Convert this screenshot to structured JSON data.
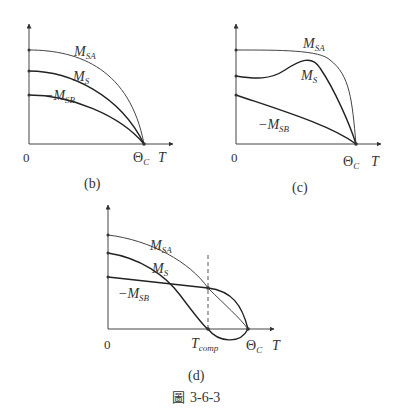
{
  "figure": {
    "caption": "圖 3-6-3",
    "caption_prefix": "圖",
    "caption_number": "3-6-3",
    "colors": {
      "axis": "#444444",
      "curve": "#333333",
      "dashed": "#555555",
      "text": "#333333"
    }
  },
  "panels": [
    {
      "id": "b",
      "label": "(b)",
      "origin_label": "0",
      "x_axis_label": "T",
      "curie_label": "Θ",
      "curie_sub": "C",
      "curves": [
        {
          "name": "M",
          "sub": "SA"
        },
        {
          "name": "M",
          "sub": "S"
        },
        {
          "name": "−M",
          "sub": "SB"
        }
      ]
    },
    {
      "id": "c",
      "label": "(c)",
      "origin_label": "0",
      "x_axis_label": "T",
      "curie_label": "Θ",
      "curie_sub": "C",
      "curves": [
        {
          "name": "M",
          "sub": "SA"
        },
        {
          "name": "M",
          "sub": "S"
        },
        {
          "name": "−M",
          "sub": "SB"
        }
      ]
    },
    {
      "id": "d",
      "label": "(d)",
      "origin_label": "0",
      "x_axis_label": "T",
      "curie_label": "Θ",
      "curie_sub": "C",
      "comp_label": "T",
      "comp_sub": "comp",
      "curves": [
        {
          "name": "M",
          "sub": "SA"
        },
        {
          "name": "M",
          "sub": "S"
        },
        {
          "name": "−M",
          "sub": "SB"
        }
      ]
    }
  ]
}
